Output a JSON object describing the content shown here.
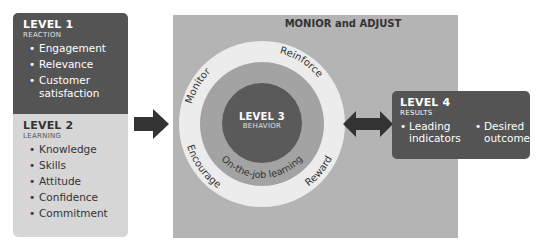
{
  "level1": {
    "title": "LEVEL 1",
    "subtitle": "REACTION",
    "items": [
      "Engagement",
      "Relevance",
      "Customer satisfaction"
    ]
  },
  "level2": {
    "title": "LEVEL 2",
    "subtitle": "LEARNING",
    "items": [
      "Knowledge",
      "Skills",
      "Attitude",
      "Confidence",
      "Commitment"
    ]
  },
  "center_panel": {
    "title": "MONIOR and ADJUST",
    "ring_labels": {
      "monitor": "Monitor",
      "reinforce": "Reinforce",
      "encourage": "Encourage",
      "reward": "Reward",
      "inner": "On-the-job learning"
    },
    "level3": {
      "title": "LEVEL 3",
      "subtitle": "BEHAVIOR"
    }
  },
  "level4": {
    "title": "LEVEL 4",
    "subtitle": "RESULTS",
    "items": [
      "Leading indicators",
      "Desired outcomes"
    ]
  },
  "colors": {
    "dark_box": "#545454",
    "light_box": "#d6d6d6",
    "panel": "#b4b4b4",
    "outer_ring": "#ececec",
    "middle_ring": "#a3a3a3",
    "core": "#5a5a5a",
    "arrow": "#333333"
  }
}
